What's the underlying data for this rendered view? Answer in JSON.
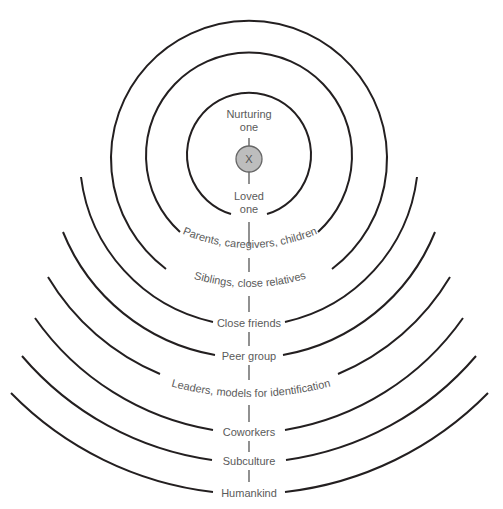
{
  "diagram": {
    "center": {
      "label": "X",
      "fill": "#bdbdbd"
    },
    "inner_labels": {
      "top_line1": "Nurturing",
      "top_line2": "one",
      "bottom_line1": "Loved",
      "bottom_line2": "one"
    },
    "rings": [
      {
        "label": "Parents, caregivers, children"
      },
      {
        "label": "Siblings, close relatives"
      },
      {
        "label": "Close friends"
      },
      {
        "label": "Peer group"
      },
      {
        "label": "Leaders, models for identification"
      },
      {
        "label": "Coworkers"
      },
      {
        "label": "Subculture"
      },
      {
        "label": "Humankind"
      }
    ],
    "stroke_color": "#231f20",
    "text_color": "#5a5a5a"
  }
}
